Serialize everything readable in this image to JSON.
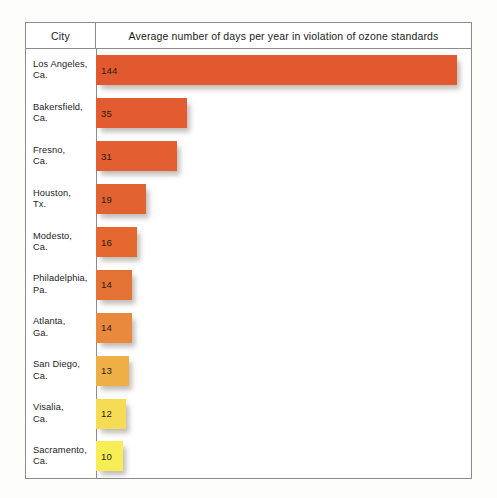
{
  "table": {
    "header": {
      "city_column_label": "City",
      "metric_column_label": "Average number of days per year in violation of ozone standards"
    }
  },
  "chart_data": {
    "type": "bar",
    "orientation": "horizontal",
    "title": "Average number of days per year in violation of ozone standards",
    "xlabel": "Average number of days per year in violation of ozone standards",
    "ylabel": "City",
    "categories": [
      "Los Angeles, Ca.",
      "Bakersfield, Ca.",
      "Fresno, Ca.",
      "Houston, Tx.",
      "Modesto, Ca.",
      "Philadelphia, Pa.",
      "Atlanta, Ga.",
      "San Diego, Ca.",
      "Visalia, Ca.",
      "Sacramento, Ca."
    ],
    "values": [
      144,
      35,
      31,
      19,
      16,
      14,
      14,
      13,
      12,
      10
    ],
    "grid": false,
    "legend": false,
    "rows": [
      {
        "city_line1": "Los Angeles,",
        "city_line2": "Ca.",
        "value": 144,
        "value_label": "144",
        "bar_px": 361,
        "color": "#E2592F"
      },
      {
        "city_line1": "Bakersfield,",
        "city_line2": "Ca.",
        "value": 35,
        "value_label": "35",
        "bar_px": 91,
        "color": "#E35B30"
      },
      {
        "city_line1": "Fresno,",
        "city_line2": "Ca.",
        "value": 31,
        "value_label": "31",
        "bar_px": 81,
        "color": "#E35E31"
      },
      {
        "city_line1": "Houston,",
        "city_line2": "Tx.",
        "value": 19,
        "value_label": "19",
        "bar_px": 50,
        "color": "#E36232"
      },
      {
        "city_line1": "Modesto,",
        "city_line2": "Ca.",
        "value": 16,
        "value_label": "16",
        "bar_px": 41,
        "color": "#E4682F"
      },
      {
        "city_line1": "Philadelphia,",
        "city_line2": "Pa.",
        "value": 14,
        "value_label": "14",
        "bar_px": 36,
        "color": "#E57235"
      },
      {
        "city_line1": "Atlanta,",
        "city_line2": "Ga.",
        "value": 14,
        "value_label": "14",
        "bar_px": 36,
        "color": "#E8893E"
      },
      {
        "city_line1": "San Diego,",
        "city_line2": "Ca.",
        "value": 13,
        "value_label": "13",
        "bar_px": 33,
        "color": "#EFAF47"
      },
      {
        "city_line1": "Visalia,",
        "city_line2": "Ca.",
        "value": 12,
        "value_label": "12",
        "bar_px": 30,
        "color": "#F6DC54"
      },
      {
        "city_line1": "Sacramento,",
        "city_line2": "Ca.",
        "value": 10,
        "value_label": "10",
        "bar_px": 27,
        "color": "#F7ED55"
      }
    ]
  }
}
